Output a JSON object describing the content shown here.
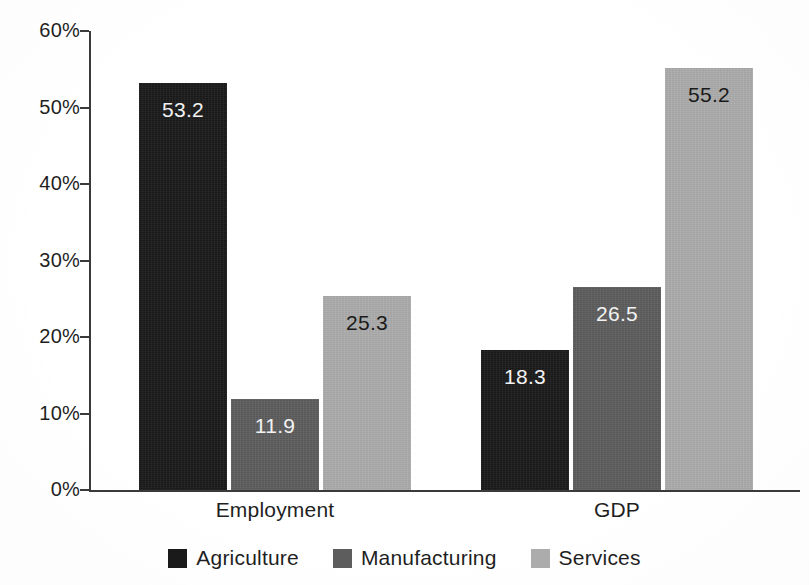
{
  "chart_data": {
    "type": "bar",
    "title": "",
    "subtitle": "",
    "xlabel": "",
    "ylabel": "",
    "categories": [
      "Employment",
      "GDP"
    ],
    "series": [
      {
        "name": "Agriculture",
        "values": [
          53.2,
          18.3
        ],
        "color": "#1a1a1a",
        "label_color": "light"
      },
      {
        "name": "Manufacturing",
        "values": [
          11.9,
          26.5
        ],
        "color": "#5d5d5d",
        "label_color": "light"
      },
      {
        "name": "Services",
        "values": [
          25.3,
          55.2
        ],
        "color": "#acacac",
        "label_color": "dark"
      }
    ],
    "value_labels": [
      [
        "53.2",
        "11.9",
        "25.3"
      ],
      [
        "18.3",
        "26.5",
        "55.2"
      ]
    ],
    "ylim": [
      0,
      60
    ],
    "ytick_values": [
      0,
      10,
      20,
      30,
      40,
      50,
      60
    ],
    "ytick_labels": [
      "0%",
      "10%",
      "20%",
      "30%",
      "40%",
      "50%",
      "60%"
    ],
    "grid": false,
    "legend_position": "bottom-center",
    "legend_entries": [
      "Agriculture",
      "Manufacturing",
      "Services"
    ],
    "units": "percent",
    "value_label_placement": "inside-top"
  },
  "axis": {
    "y_ticks": [
      {
        "label": "60%",
        "value": 60
      },
      {
        "label": "50%",
        "value": 50
      },
      {
        "label": "40%",
        "value": 40
      },
      {
        "label": "30%",
        "value": 30
      },
      {
        "label": "20%",
        "value": 20
      },
      {
        "label": "10%",
        "value": 10
      },
      {
        "label": "0%",
        "value": 0
      }
    ],
    "x_categories": [
      {
        "label": "Employment"
      },
      {
        "label": "GDP"
      }
    ]
  },
  "legend": {
    "items": [
      {
        "label": "Agriculture",
        "color": "#1a1a1a"
      },
      {
        "label": "Manufacturing",
        "color": "#5d5d5d"
      },
      {
        "label": "Services",
        "color": "#acacac"
      }
    ]
  },
  "bars": [
    {
      "group": "Employment",
      "series": "Agriculture",
      "value": 53.2,
      "label": "53.2"
    },
    {
      "group": "Employment",
      "series": "Manufacturing",
      "value": 11.9,
      "label": "11.9"
    },
    {
      "group": "Employment",
      "series": "Services",
      "value": 25.3,
      "label": "25.3"
    },
    {
      "group": "GDP",
      "series": "Agriculture",
      "value": 18.3,
      "label": "18.3"
    },
    {
      "group": "GDP",
      "series": "Manufacturing",
      "value": 26.5,
      "label": "26.5"
    },
    {
      "group": "GDP",
      "series": "Services",
      "value": 55.2,
      "label": "55.2"
    }
  ]
}
